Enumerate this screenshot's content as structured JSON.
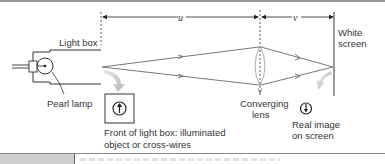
{
  "diagram": {
    "labels": {
      "light_box": "Light box",
      "pearl_lamp": "Pearl lamp",
      "front_line1": "Front of light box: illuminated",
      "front_line2": "object or cross-wires",
      "lens_line1": "Converging",
      "lens_line2": "lens",
      "image_line1": "Real image",
      "image_line2": "on screen",
      "screen_line1": "White",
      "screen_line2": "screen",
      "u": "u",
      "v": "v"
    }
  }
}
